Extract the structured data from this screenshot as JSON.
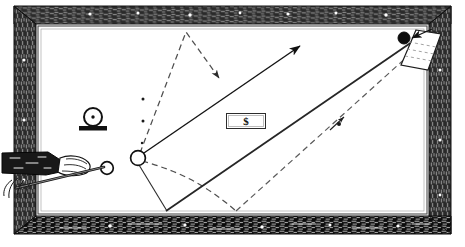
{
  "figure": {
    "type": "line-art illustration",
    "canvas": {
      "width": 465,
      "height": 247
    },
    "background_color": "#ffffff",
    "ink_color": "#1a1a1a"
  },
  "labels": {
    "dollar_box": "$"
  },
  "table": {
    "frame": {
      "name": "wooden-rail-frame",
      "outer": {
        "x": 14,
        "y": 6,
        "width": 437,
        "height": 228
      },
      "inner": {
        "x": 36,
        "y": 24,
        "width": 393,
        "height": 192
      },
      "texture": "woodgrain-hatching",
      "base_color": "#3b3b3b",
      "highlight_color": "#ffffff",
      "inlay_dots": 14
    },
    "cloth": {
      "name": "table-bed",
      "x": 40,
      "y": 28,
      "width": 385,
      "height": 184,
      "color": "#ffffff",
      "border_color": "#555555"
    }
  },
  "balls": [
    {
      "name": "cue-ball",
      "cx": 107,
      "cy": 168,
      "r": 6.5,
      "fill": "#ffffff",
      "stroke": "#111111"
    },
    {
      "name": "object-ball",
      "cx": 138,
      "cy": 158,
      "r": 7.5,
      "fill": "#ffffff",
      "stroke": "#111111"
    },
    {
      "name": "target-ball-black",
      "cx": 404,
      "cy": 38,
      "r": 6,
      "fill": "#0d0d0d",
      "stroke": "#0d0d0d"
    }
  ],
  "markers": {
    "spot_ball_on_rest": {
      "name": "spotted-ball-on-rest",
      "cx": 93,
      "cy": 117,
      "r": 9,
      "dot_r": 1.6,
      "base": {
        "x": 80,
        "y": 127,
        "width": 27,
        "height": 4
      }
    },
    "guide_dots": [
      {
        "cx": 143,
        "cy": 99,
        "r": 1.4
      },
      {
        "cx": 143,
        "cy": 121,
        "r": 1.4
      },
      {
        "cx": 142,
        "cy": 143,
        "r": 1.2
      },
      {
        "cx": 339,
        "cy": 124,
        "r": 1.8
      }
    ]
  },
  "cue": {
    "name": "cue-stick-and-hand",
    "sleeve": {
      "x": 2,
      "y": 154,
      "width": 52,
      "height": 17,
      "fill": "#1a1a1a"
    },
    "hand": {
      "cx": 72,
      "cy": 168
    },
    "stick": {
      "x1": 18,
      "y1": 186,
      "x2": 104,
      "y2": 168
    }
  },
  "paths": {
    "solid_main_arrow": {
      "name": "primary-shot-arrow",
      "style": "solid",
      "points": [
        [
          141,
          155
        ],
        [
          300,
          46
        ]
      ],
      "arrowhead": "end"
    },
    "solid_band": {
      "name": "cushion-band-line",
      "style": "solid-thick",
      "points": [
        [
          166,
          211
        ],
        [
          425,
          33
        ]
      ]
    },
    "solid_v": {
      "name": "rebound-v-line",
      "style": "solid",
      "points": [
        [
          136,
          160
        ],
        [
          167,
          211
        ]
      ]
    },
    "dashed_peak": {
      "name": "dashed-peak-path",
      "style": "dashed",
      "points": [
        [
          140,
          153
        ],
        [
          186,
          32
        ],
        [
          219,
          78
        ]
      ],
      "arrowhead": "end"
    },
    "dashed_curve": {
      "name": "dashed-curve-path",
      "style": "dashed-curve",
      "points": [
        [
          142,
          160
        ],
        [
          200,
          180
        ],
        [
          236,
          211
        ]
      ]
    },
    "dashed_long_diagonal": {
      "name": "dashed-long-diagonal",
      "style": "dashed",
      "points": [
        [
          236,
          211
        ],
        [
          418,
          47
        ]
      ],
      "arrowhead": "mid"
    },
    "dashed_to_black_ball": {
      "name": "dashed-approach-to-black-ball",
      "style": "dashed",
      "points": [
        [
          408,
          40
        ],
        [
          430,
          30
        ]
      ],
      "arrowhead": "start"
    },
    "paper_strip": {
      "name": "paper-strip-quadrilateral",
      "points": [
        [
          415,
          31
        ],
        [
          440,
          33
        ],
        [
          428,
          69
        ],
        [
          400,
          66
        ]
      ]
    }
  },
  "colors": {
    "ink": "#1a1a1a",
    "dashed": "#6a6a6a",
    "frame_dark": "#2e2e2e",
    "frame_light": "#d9d9d9",
    "paper": "#ffffff"
  }
}
